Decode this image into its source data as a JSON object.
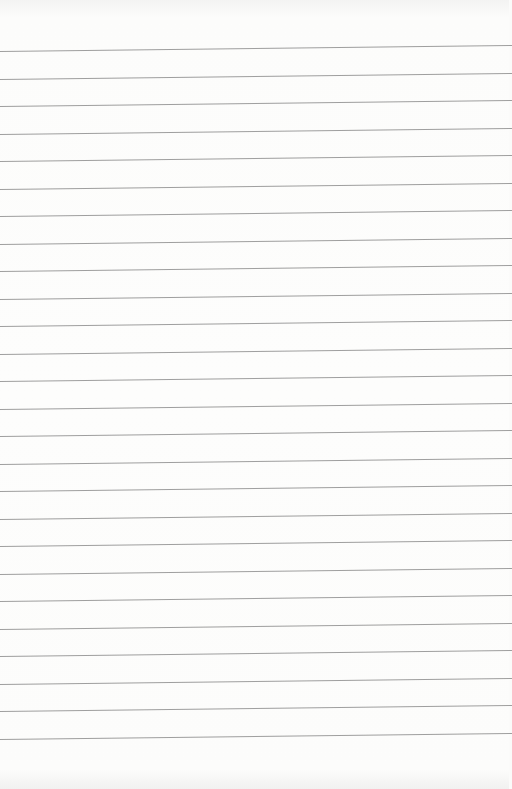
{
  "page": {
    "type": "blank lined paper",
    "background_color": "#fbfbfa",
    "line_color": "#8d8d8d",
    "line_count": 26,
    "first_line_y": 51,
    "line_spacing_px": 27.5
  }
}
